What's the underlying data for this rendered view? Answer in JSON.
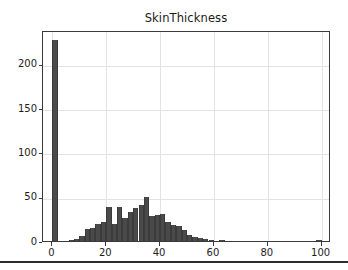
{
  "figure": {
    "title": "SkinThickness",
    "background_color": "#ffffff",
    "frame_color": "#3a3a3a",
    "grid_color": "#e3e3e3",
    "bar_color": "#4a4a4a",
    "text_color": "#1d1d1d"
  },
  "chart_data": {
    "type": "bar",
    "title": "SkinThickness",
    "xlabel": "",
    "ylabel": "",
    "xlim": [
      -3.5,
      103.5
    ],
    "ylim": [
      0,
      238
    ],
    "grid": true,
    "legend": null,
    "xticks": [
      0,
      20,
      40,
      60,
      80,
      100
    ],
    "xtick_labels": [
      "0",
      "20",
      "40",
      "60",
      "80",
      "100"
    ],
    "yticks": [
      0,
      50,
      100,
      150,
      200
    ],
    "ytick_labels": [
      "0",
      "50",
      "100",
      "150",
      "200"
    ],
    "bin_width": 1.98,
    "categories": [
      "0",
      "2",
      "4",
      "6",
      "8",
      "10",
      "12",
      "14",
      "16",
      "18",
      "20",
      "22",
      "24",
      "26",
      "28",
      "30",
      "32",
      "34",
      "36",
      "38",
      "40",
      "42",
      "44",
      "46",
      "48",
      "50",
      "52",
      "54",
      "56",
      "58",
      "60",
      "62",
      "64",
      "66",
      "68",
      "70",
      "72",
      "74",
      "76",
      "78",
      "80",
      "82",
      "84",
      "86",
      "88",
      "90",
      "92",
      "94",
      "96",
      "98"
    ],
    "values": [
      227,
      0,
      0,
      1,
      2,
      6,
      14,
      15,
      19,
      22,
      38,
      19,
      38,
      26,
      33,
      37,
      41,
      50,
      28,
      29,
      31,
      22,
      18,
      17,
      12,
      7,
      5,
      3,
      2,
      1,
      0,
      1,
      0,
      0,
      0,
      0,
      0,
      0,
      0,
      0,
      0,
      0,
      0,
      0,
      0,
      0,
      0,
      0,
      0,
      1
    ]
  }
}
